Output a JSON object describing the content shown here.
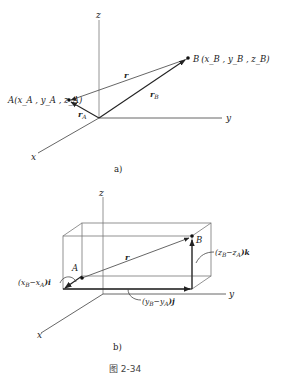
{
  "figure": {
    "caption": "图 2-34",
    "panels": [
      {
        "id": "a",
        "label": "a)",
        "axes": {
          "x": "x",
          "y": "y",
          "z": "z"
        },
        "points": {
          "A": {
            "name": "A",
            "coords": "(x_A , y_A , z_A)"
          },
          "B": {
            "name": "B",
            "coords": "(x_B , y_B , z_B)"
          }
        },
        "vectors": {
          "r": "r",
          "rA": "r",
          "rA_sub": "A",
          "rB": "r",
          "rB_sub": "B"
        }
      },
      {
        "id": "b",
        "label": "b)",
        "axes": {
          "x": "x",
          "y": "y",
          "z": "z"
        },
        "points": {
          "A": "A",
          "B": "B"
        },
        "vectors": {
          "r": "r"
        },
        "components": {
          "i_pre": "(x",
          "i_sub1": "B",
          "i_mid": "−x",
          "i_sub2": "A",
          "i_post": ")i",
          "j_pre": "(y",
          "j_sub1": "B",
          "j_mid": "−y",
          "j_sub2": "A",
          "j_post": ")j",
          "k_pre": "(z",
          "k_sub1": "B",
          "k_mid": "−z",
          "k_sub2": "A",
          "k_post": ")k"
        }
      }
    ]
  }
}
